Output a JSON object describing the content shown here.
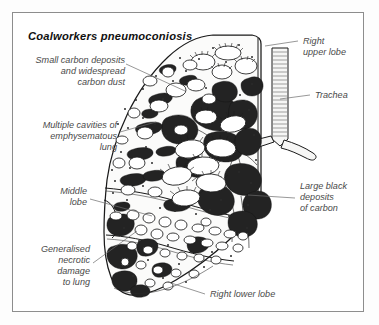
{
  "figure": {
    "title": "Coalworkers pneumoconiosis",
    "frame_color": "#8d8d8d",
    "background_color": "#ffffff",
    "ink_color": "#1a1a1a",
    "carbon_color": "#232323",
    "label_color": "#4a4a4a"
  },
  "labels": {
    "small_carbon": {
      "lines": [
        "Small carbon deposits",
        "and widespread",
        "carbon dust"
      ],
      "align": "right"
    },
    "multiple_cavities": {
      "lines": [
        "Multiple cavities of",
        "emphysematous",
        "lung"
      ],
      "align": "right"
    },
    "middle_lobe": {
      "lines": [
        "Middle",
        "lobe"
      ],
      "align": "right"
    },
    "generalised_necrotic": {
      "lines": [
        "Generalised",
        "necrotic",
        "damage",
        "to lung"
      ],
      "align": "right"
    },
    "right_upper_lobe": {
      "lines": [
        "Right",
        "upper lobe"
      ],
      "align": "left"
    },
    "trachea": {
      "lines": [
        "Trachea"
      ],
      "align": "left"
    },
    "large_black_deposits": {
      "lines": [
        "Large black",
        "deposits",
        "of carbon"
      ],
      "align": "left"
    },
    "right_lower_lobe": {
      "lines": [
        "Right lower lobe"
      ],
      "align": "left"
    }
  }
}
